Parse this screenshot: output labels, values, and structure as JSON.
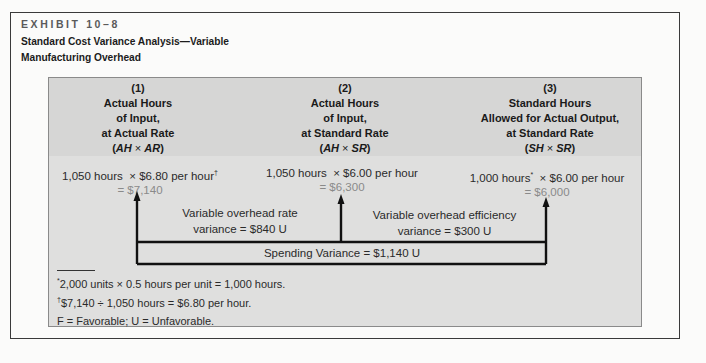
{
  "exhibit": {
    "label": "EXHIBIT 10–8",
    "title_line1": "Standard Cost Variance Analysis—Variable",
    "title_line2": "Manufacturing Overhead"
  },
  "columns": [
    {
      "number": "(1)",
      "line1": "Actual Hours",
      "line2": "of Input,",
      "line3": "at Actual Rate",
      "formula_a": "AH",
      "formula_op": "×",
      "formula_b": "AR",
      "calc_hours": "1,050 hours",
      "calc_mult": "× $6.80 per hour",
      "calc_marker": "†",
      "calc_result": "= $7,140"
    },
    {
      "number": "(2)",
      "line1": "Actual Hours",
      "line2": "of Input,",
      "line3": "at Standard Rate",
      "formula_a": "AH",
      "formula_op": "×",
      "formula_b": "SR",
      "calc_hours": "1,050 hours",
      "calc_mult": "× $6.00 per hour",
      "calc_marker": "",
      "calc_result": "= $6,300"
    },
    {
      "number": "(3)",
      "line1": "Standard Hours",
      "line2": "Allowed for Actual Output,",
      "line3": "at Standard Rate",
      "formula_a": "SH",
      "formula_op": "×",
      "formula_b": "SR",
      "calc_hours": "1,000 hours",
      "calc_hours_marker": "*",
      "calc_mult": "× $6.00 per hour",
      "calc_marker": "",
      "calc_result": "= $6,000"
    }
  ],
  "variances": {
    "rate_line1": "Variable overhead rate",
    "rate_line2": "variance = $840 U",
    "efficiency_line1": "Variable overhead efficiency",
    "efficiency_line2": "variance = $300 U",
    "spending": "Spending Variance = $1,140 U"
  },
  "footnotes": [
    {
      "marker": "*",
      "text": "2,000 units × 0.5 hours per unit = 1,000 hours."
    },
    {
      "marker": "†",
      "text": "$7,140 ÷ 1,050 hours = $6.80 per hour."
    },
    {
      "marker": "",
      "text": "F = Favorable; U = Unfavorable."
    }
  ]
}
